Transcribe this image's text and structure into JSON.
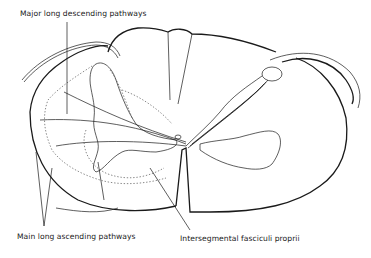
{
  "figure": {
    "type": "spinal cord cross-section line drawing",
    "colors": {
      "line": "#1a1a1a",
      "background": "#ffffff",
      "dotted": "#555555"
    }
  },
  "labels": {
    "descending": "Major long descending pathways",
    "ascending": "Main long ascending pathways",
    "intersegmental": "Intersegmental fasciculi proprii"
  }
}
